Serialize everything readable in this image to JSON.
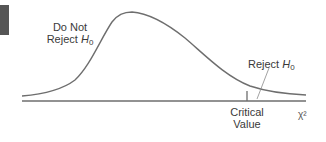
{
  "diagram": {
    "labels": {
      "do_not_reject_line1": "Do Not",
      "do_not_reject_line2_prefix": "Reject ",
      "do_not_reject_h": "H",
      "do_not_reject_sub": "0",
      "reject_prefix": "Reject ",
      "reject_h": "H",
      "reject_sub": "0",
      "critical_line1": "Critical",
      "critical_line2": "Value",
      "axis_label": "χ²"
    },
    "colors": {
      "curve": "#6e6e6e",
      "axis": "#6e6e6e",
      "text": "#3a3a3a",
      "side_block": "#555555"
    }
  }
}
